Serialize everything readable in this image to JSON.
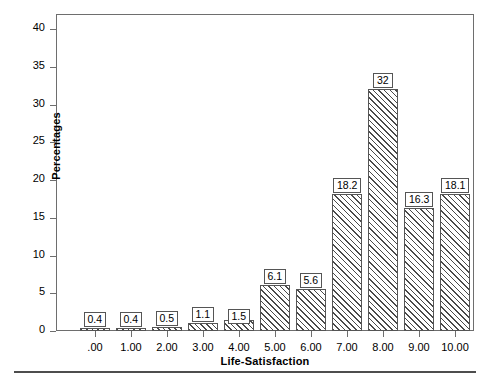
{
  "chart_data": {
    "type": "bar",
    "title": "",
    "xlabel": "Life-Satisfaction",
    "ylabel": "Percentages",
    "categories": [
      ".00",
      "1.00",
      "2.00",
      "3.00",
      "4.00",
      "5.00",
      "6.00",
      "7.00",
      "8.00",
      "9.00",
      "10.00"
    ],
    "values": [
      0.4,
      0.4,
      0.5,
      1.1,
      1.5,
      6.1,
      5.6,
      18.2,
      32,
      16.3,
      18.1
    ],
    "data_labels": [
      "0.4",
      "0.4",
      "0.5",
      "1.1",
      "1.5",
      "6.1",
      "5.6",
      "18.2",
      "32",
      "16.3",
      "18.1"
    ],
    "ylim": [
      0,
      42
    ],
    "y_ticks": [
      0,
      5,
      10,
      15,
      20,
      25,
      30,
      35,
      40
    ],
    "y_tick_labels": [
      "0",
      "5",
      "10",
      "15",
      "20",
      "25",
      "30",
      "35",
      "40"
    ],
    "grid": false,
    "legend": false,
    "bar_fill": "diagonal-hatch",
    "colors": {
      "bar_edge": "#555555",
      "bar_hatch": "#4a4a4a",
      "frame": "#6e6e6e",
      "text": "#000000"
    }
  }
}
